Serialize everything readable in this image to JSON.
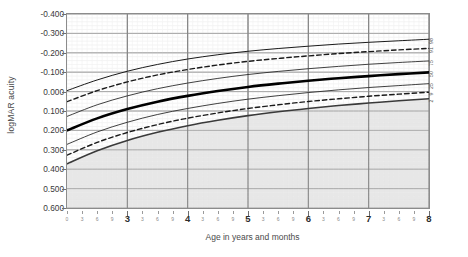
{
  "chart_data": {
    "type": "line",
    "title": "",
    "xlabel": "Age in years and months",
    "ylabel": "logMAR acuity",
    "xlim": [
      2.0,
      8.0
    ],
    "ylim": [
      -0.4,
      0.6
    ],
    "y_inverted": true,
    "grid": true,
    "legend_position": "right-axis-labels",
    "ytick_labels": [
      "-0.400",
      "-0.300",
      "-0.200",
      "-0.100",
      "0.000",
      "0.100",
      "0.200",
      "0.300",
      "0.400",
      "0.500",
      "0.600"
    ],
    "ytick_values": [
      -0.4,
      -0.3,
      -0.2,
      -0.1,
      0.0,
      0.1,
      0.2,
      0.3,
      0.4,
      0.5,
      0.6
    ],
    "xtick_major_labels": [
      "3",
      "4",
      "5",
      "6",
      "7",
      "8"
    ],
    "xtick_major_values": [
      3,
      4,
      5,
      6,
      7,
      8
    ],
    "xtick_minor_labels": [
      "0",
      "3",
      "6",
      "9",
      "3",
      "6",
      "9",
      "3",
      "6",
      "9",
      "3",
      "6",
      "9",
      "3",
      "6",
      "9",
      "3",
      "6",
      "9"
    ],
    "xtick_minor_values": [
      2.0,
      2.25,
      2.5,
      2.75,
      3.25,
      3.5,
      3.75,
      4.25,
      4.5,
      4.75,
      5.25,
      5.5,
      5.75,
      6.25,
      6.5,
      6.75,
      7.25,
      7.5,
      7.75
    ],
    "shaded_region": {
      "label": "below 2nd centile",
      "color": "#d9d9d9",
      "bounded_by": "p2"
    },
    "x": [
      2.0,
      2.5,
      3.0,
      3.5,
      4.0,
      4.5,
      5.0,
      5.5,
      6.0,
      6.5,
      7.0,
      7.5,
      8.0
    ],
    "series": [
      {
        "name": "98",
        "label": "98",
        "style": "solid",
        "width": 1.0,
        "color": "#1a1a1a",
        "values": [
          -0.005,
          -0.06,
          -0.105,
          -0.14,
          -0.168,
          -0.19,
          -0.208,
          -0.222,
          -0.234,
          -0.245,
          -0.254,
          -0.262,
          -0.27
        ]
      },
      {
        "name": "91",
        "label": "91",
        "style": "dashed",
        "width": 1.4,
        "color": "#1a1a1a",
        "values": [
          0.052,
          -0.005,
          -0.05,
          -0.086,
          -0.114,
          -0.137,
          -0.156,
          -0.171,
          -0.184,
          -0.196,
          -0.206,
          -0.215,
          -0.223
        ]
      },
      {
        "name": "75",
        "label": "75",
        "style": "solid",
        "width": 0.9,
        "color": "#2a2a2a",
        "values": [
          0.128,
          0.068,
          0.022,
          -0.015,
          -0.044,
          -0.068,
          -0.088,
          -0.104,
          -0.118,
          -0.13,
          -0.141,
          -0.15,
          -0.158
        ]
      },
      {
        "name": "50",
        "label": "50",
        "style": "solid",
        "width": 2.6,
        "color": "#000000",
        "values": [
          0.2,
          0.138,
          0.09,
          0.052,
          0.022,
          -0.003,
          -0.024,
          -0.041,
          -0.056,
          -0.069,
          -0.08,
          -0.09,
          -0.099
        ]
      },
      {
        "name": "25",
        "label": "25",
        "style": "solid",
        "width": 0.9,
        "color": "#2a2a2a",
        "values": [
          0.272,
          0.208,
          0.158,
          0.118,
          0.087,
          0.061,
          0.039,
          0.021,
          0.005,
          -0.009,
          -0.021,
          -0.031,
          -0.041
        ]
      },
      {
        "name": "9",
        "label": "9",
        "style": "dashed",
        "width": 1.4,
        "color": "#1a1a1a",
        "values": [
          0.328,
          0.262,
          0.211,
          0.17,
          0.137,
          0.11,
          0.087,
          0.068,
          0.051,
          0.037,
          0.024,
          0.013,
          0.003
        ]
      },
      {
        "name": "2",
        "label": "2",
        "style": "solid",
        "width": 1.6,
        "color": "#3a3a3a",
        "values": [
          0.372,
          0.305,
          0.252,
          0.21,
          0.176,
          0.148,
          0.124,
          0.104,
          0.087,
          0.072,
          0.059,
          0.047,
          0.037
        ]
      }
    ]
  },
  "axis": {
    "ylabel": "logMAR acuity",
    "xlabel": "Age in years and months"
  }
}
